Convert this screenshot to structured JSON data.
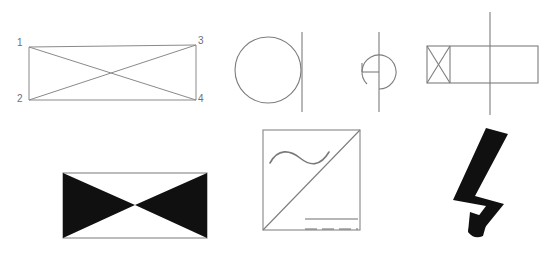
{
  "plate": {
    "background_color": "#ffffff",
    "width": 558,
    "height": 266,
    "line_color": "#8a8a8a",
    "fill_color": "#101010"
  },
  "figures": {
    "bowtie_outline": {
      "name": "numbered-bowtie-outline",
      "labels": [
        {
          "text": "1",
          "x": 17,
          "y": 38,
          "corner": "top-left"
        },
        {
          "text": "2",
          "x": 17,
          "y": 94,
          "corner": "bottom-left"
        },
        {
          "text": "3",
          "x": 198,
          "y": 36,
          "corner": "top-right"
        },
        {
          "text": "4",
          "x": 198,
          "y": 94,
          "corner": "bottom-right"
        }
      ],
      "corners": {
        "p1": [
          29,
          47
        ],
        "p2": [
          29,
          100
        ],
        "p3": [
          196,
          45
        ],
        "p4": [
          196,
          100
        ]
      }
    },
    "circle_with_line": {
      "name": "circle-with-vertical-line",
      "center": [
        268,
        70
      ],
      "radius": 33,
      "line_x": 302,
      "line_y1": 32,
      "line_y2": 112
    },
    "partial_circle": {
      "name": "partial-circle-g-symbol",
      "center": [
        379,
        72
      ],
      "radius": 17,
      "stub_x": 362,
      "line_x": 379,
      "line_y1": 32,
      "line_y2": 112
    },
    "xbox_rectangle": {
      "name": "x-box-rectangle-with-line",
      "rect": [
        427,
        46,
        111,
        37
      ],
      "xbox_right": 450,
      "line_x": 490,
      "line_y1": 12,
      "line_y2": 115
    },
    "bowtie_filled": {
      "name": "filled-bowtie-rectangle",
      "rect": [
        63,
        173,
        144,
        65
      ],
      "center": [
        135,
        205
      ]
    },
    "square_diagram": {
      "name": "square-with-diagonal-and-lines",
      "rect": [
        263,
        130,
        97,
        100
      ],
      "diagonal_from": [
        263,
        230
      ],
      "diagonal_to": [
        360,
        130
      ],
      "solid_line": {
        "x1": 305,
        "y1": 219,
        "x2": 358,
        "y2": 219
      },
      "dashed_line": {
        "x1": 305,
        "y1": 229,
        "x2": 358,
        "y2": 229
      },
      "wave_label": "tilde-wave"
    },
    "lightning_bolt": {
      "name": "lightning-bolt",
      "bounds": [
        453,
        128,
        55,
        108
      ]
    }
  }
}
